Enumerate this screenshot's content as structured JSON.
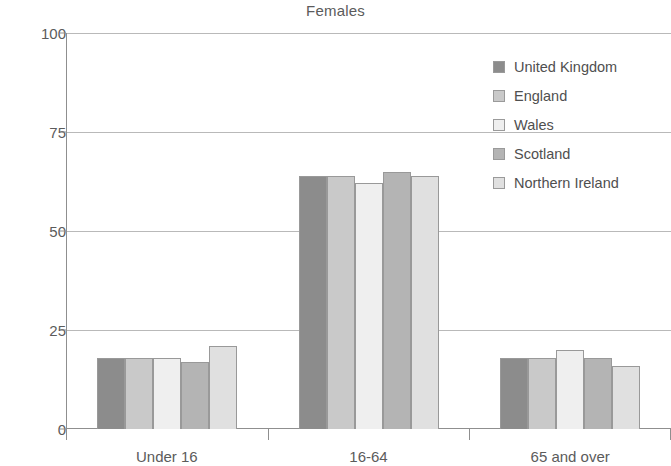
{
  "chart_data": {
    "type": "bar",
    "title": "Females",
    "xlabel": "",
    "ylabel": "",
    "categories": [
      "Under 16",
      "16-64",
      "65 and over"
    ],
    "series": [
      {
        "name": "United Kingdom",
        "color": "#8c8c8c",
        "values": [
          18,
          64,
          18
        ]
      },
      {
        "name": "England",
        "color": "#c9c9c9",
        "values": [
          18,
          64,
          18
        ]
      },
      {
        "name": "Wales",
        "color": "#efefef",
        "values": [
          18,
          62,
          20
        ]
      },
      {
        "name": "Scotland",
        "color": "#b4b4b4",
        "values": [
          17,
          65,
          18
        ]
      },
      {
        "name": "Northern Ireland",
        "color": "#e0e0e0",
        "values": [
          21,
          64,
          16
        ]
      }
    ],
    "ylim": [
      0,
      100
    ],
    "yticks": [
      0,
      25,
      50,
      75,
      100
    ],
    "ytick_labels": [
      "0",
      "25",
      "50",
      "75",
      "100"
    ],
    "grid": true,
    "legend_position": "top-right",
    "axis_color": "#8f8f8f",
    "grid_color": "#b9b9b9",
    "text_color": "#5b5b5b"
  }
}
